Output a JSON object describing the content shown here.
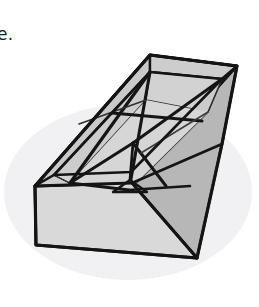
{
  "page": {
    "width": 259,
    "height": 307,
    "background_color": "#ffffff"
  },
  "caption": {
    "text": "se.",
    "note": "clipped trailing fragment of a sentence at the top-left of the crop"
  },
  "figure": {
    "colors": {
      "outline": "#151515",
      "crease_line": "#3a3a3a",
      "top_face": "#d0d0d0",
      "front_face": "#d8d8d8",
      "right_face": "#b9b9b9",
      "left_inner_wall": "#c6c6c6",
      "inner_base": "#d5d5d5",
      "shadow": "#f0f0f2",
      "rim_top": "#cfcfcf"
    },
    "geometry": {
      "rim_outer": {
        "back": [
          150,
          55
        ],
        "right": [
          237,
          66
        ],
        "front": [
          132,
          183
        ],
        "left": [
          35,
          186
        ]
      },
      "rim_inner": {
        "back": [
          150,
          72
        ],
        "right": [
          222,
          79
        ],
        "front": [
          131,
          172
        ],
        "left": [
          54,
          175
        ]
      },
      "front_face_bottom": {
        "left": [
          36,
          245
        ],
        "right": [
          197,
          258
        ]
      },
      "right_face_bottom": [
        222,
        144
      ],
      "base_center": [
        133,
        143
      ],
      "base_corners": {
        "back": [
          146,
          100
        ],
        "right": [
          208,
          112
        ],
        "front": [
          129,
          190
        ],
        "left": [
          70,
          183
        ]
      },
      "tent_apex": [
        130,
        180
      ],
      "tent_base_left": [
        113,
        192
      ],
      "tent_base_right": [
        146,
        192
      ]
    },
    "shadow_ellipse": {
      "cx": 128,
      "cy": 190,
      "rx": 122,
      "ry": 86
    }
  }
}
